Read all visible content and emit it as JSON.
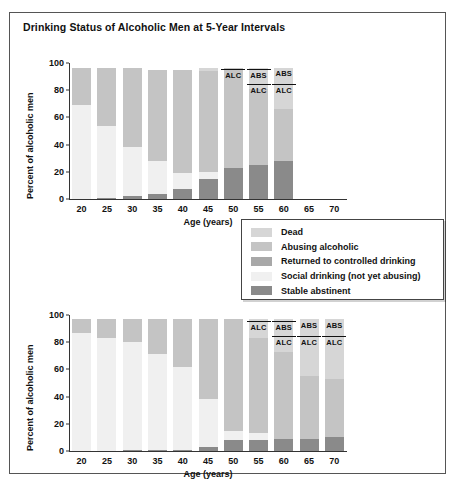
{
  "figure": {
    "title": "Drinking Status of Alcoholic Men at 5-Year Intervals",
    "border_color": "#555555",
    "background": "#ffffff"
  },
  "legend": {
    "position": "center-right, between panels",
    "items": [
      {
        "label": "Dead",
        "color": "#d6d6d6"
      },
      {
        "label": "Abusing alcoholic",
        "color": "#c4c4c4"
      },
      {
        "label": "Returned to controlled drinking",
        "color": "#a8a8a8"
      },
      {
        "label": "Social drinking (not yet abusing)",
        "color": "#f0f0f0"
      },
      {
        "label": "Stable abstinent",
        "color": "#8a8a8a"
      }
    ]
  },
  "axes": {
    "ylabel": "Percent of alcoholic men",
    "xlabel": "Age (years)",
    "yticks": [
      0,
      20,
      40,
      60,
      80,
      100
    ],
    "ylim": [
      0,
      100
    ],
    "xticks": [
      20,
      25,
      30,
      35,
      40,
      45,
      50,
      55,
      60,
      65,
      70
    ]
  },
  "annotations": {
    "abs_label": "ABS",
    "alc_label": "ALC"
  },
  "chart_data": [
    {
      "type": "bar",
      "id": "upper-panel",
      "title": "",
      "stacked": true,
      "xlabel": "Age (years)",
      "ylabel": "Percent of alcoholic men",
      "ylim": [
        0,
        100
      ],
      "grid": false,
      "categories": [
        "20",
        "25",
        "30",
        "35",
        "40",
        "45",
        "50",
        "55",
        "60",
        "65",
        "70"
      ],
      "series": [
        {
          "name": "Stable abstinent",
          "color": "#8a8a8a",
          "values": [
            0,
            1,
            2,
            4,
            7,
            15,
            23,
            25,
            28,
            null,
            null
          ]
        },
        {
          "name": "Social drinking (not yet abusing)",
          "color": "#f0f0f0",
          "values": [
            69,
            53,
            36,
            24,
            12,
            5,
            0,
            0,
            0,
            null,
            null
          ]
        },
        {
          "name": "Returned to controlled drinking",
          "color": "#a8a8a8",
          "values": [
            0,
            0,
            0,
            0,
            0,
            0,
            0,
            0,
            0,
            null,
            null
          ]
        },
        {
          "name": "Abusing alcoholic",
          "color": "#c4c4c4",
          "values": [
            27,
            42,
            58,
            67,
            76,
            74,
            73,
            56,
            38,
            null,
            null
          ]
        },
        {
          "name": "Dead",
          "color": "#d6d6d6",
          "values": [
            0,
            0,
            0,
            0,
            0,
            2,
            0,
            15,
            30,
            null,
            null
          ]
        }
      ],
      "bar_annotations": [
        {
          "category": "50",
          "labels": [
            {
              "text": "ALC",
              "rule": true
            }
          ]
        },
        {
          "category": "55",
          "labels": [
            {
              "text": "ABS",
              "rule": true
            },
            {
              "text": "ALC",
              "rule": true
            }
          ]
        },
        {
          "category": "60",
          "labels": [
            {
              "text": "ABS",
              "rule": false
            },
            {
              "text": "ALC",
              "rule": true
            }
          ]
        }
      ]
    },
    {
      "type": "bar",
      "id": "lower-panel",
      "title": "",
      "stacked": true,
      "xlabel": "Age (years)",
      "ylabel": "Percent of alcoholic men",
      "ylim": [
        0,
        100
      ],
      "grid": false,
      "categories": [
        "20",
        "25",
        "30",
        "35",
        "40",
        "45",
        "50",
        "55",
        "60",
        "65",
        "70"
      ],
      "series": [
        {
          "name": "Stable abstinent",
          "color": "#8a8a8a",
          "values": [
            0,
            0,
            1,
            1,
            1,
            3,
            8,
            8,
            9,
            9,
            10
          ]
        },
        {
          "name": "Social drinking (not yet abusing)",
          "color": "#f0f0f0",
          "values": [
            87,
            83,
            79,
            70,
            61,
            35,
            7,
            5,
            0,
            0,
            0
          ]
        },
        {
          "name": "Returned to controlled drinking",
          "color": "#a8a8a8",
          "values": [
            0,
            0,
            0,
            0,
            0,
            0,
            0,
            0,
            0,
            0,
            0
          ]
        },
        {
          "name": "Abusing alcoholic",
          "color": "#c4c4c4",
          "values": [
            10,
            14,
            17,
            26,
            35,
            59,
            82,
            70,
            64,
            46,
            43
          ]
        },
        {
          "name": "Dead",
          "color": "#d6d6d6",
          "values": [
            0,
            0,
            0,
            0,
            0,
            0,
            0,
            14,
            24,
            42,
            44
          ]
        }
      ],
      "bar_annotations": [
        {
          "category": "55",
          "labels": [
            {
              "text": "ALC",
              "rule": true
            }
          ]
        },
        {
          "category": "60",
          "labels": [
            {
              "text": "ABS",
              "rule": true
            },
            {
              "text": "ALC",
              "rule": true
            }
          ]
        },
        {
          "category": "65",
          "labels": [
            {
              "text": "ABS",
              "rule": false
            },
            {
              "text": "ALC",
              "rule": true
            }
          ]
        },
        {
          "category": "70",
          "labels": [
            {
              "text": "ABS",
              "rule": false
            },
            {
              "text": "ALC",
              "rule": true
            }
          ]
        }
      ]
    }
  ]
}
